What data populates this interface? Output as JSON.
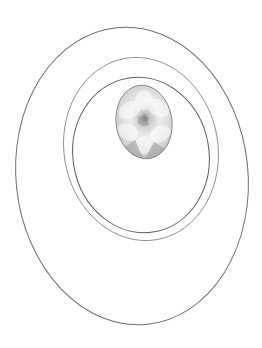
{
  "figure": {
    "colors": {
      "background": "#ffffff",
      "outer_ring": "#6e6e6e",
      "middle_ring": "#8a8a8a",
      "inner_ring": "#5c5c5c",
      "photo_base": "#b8b8b8",
      "photo_highlight": "#f2f2f2",
      "photo_center": "#8a8a8a"
    },
    "photo_subject": "flower-photo"
  }
}
